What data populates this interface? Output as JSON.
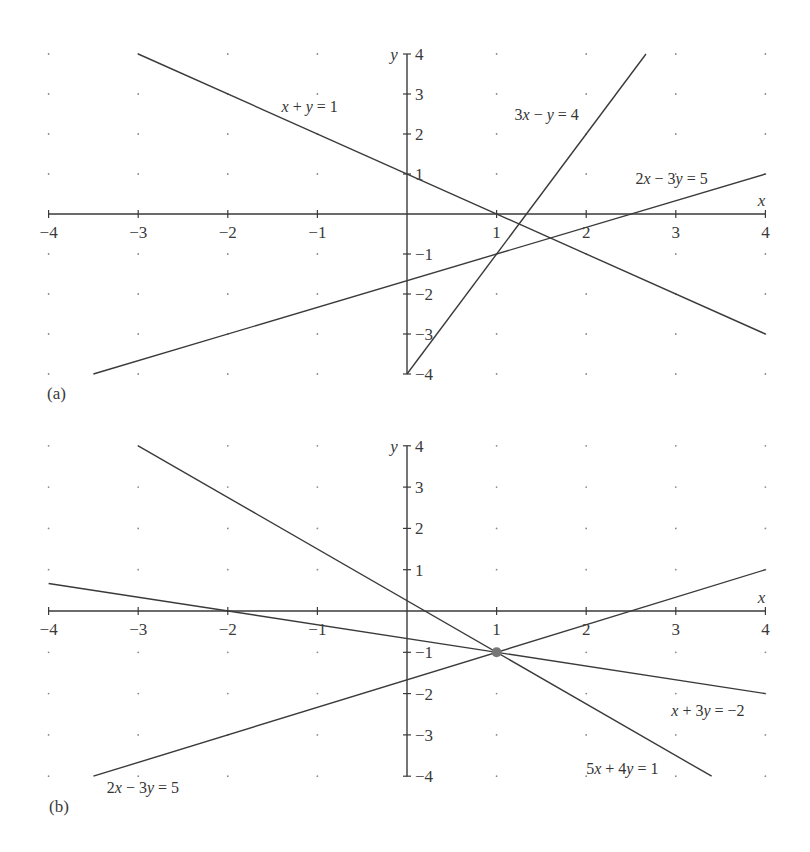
{
  "chart_data": [
    {
      "type": "line",
      "panel_label": "(a)",
      "title": "",
      "xlabel": "x",
      "ylabel": "y",
      "xlim": [
        -4,
        4
      ],
      "ylim": [
        -4,
        4
      ],
      "grid": "dotted points at integer coordinates",
      "x_ticks": [
        -4,
        -3,
        -2,
        -1,
        1,
        2,
        3,
        4
      ],
      "y_ticks": [
        -4,
        -3,
        -2,
        -1,
        1,
        2,
        3,
        4
      ],
      "x_tick_labels": [
        "−4",
        "−3",
        "−2",
        "−1",
        "1",
        "2",
        "3",
        "4"
      ],
      "y_tick_labels": [
        "−4",
        "−3",
        "−2",
        "−1",
        "1",
        "2",
        "3",
        "4"
      ],
      "series": [
        {
          "name": "x + y = 1",
          "x": [
            -3,
            4
          ],
          "y": [
            4,
            -3
          ]
        },
        {
          "name": "3x − y = 4",
          "x": [
            0,
            2.667
          ],
          "y": [
            -4,
            4
          ]
        },
        {
          "name": "2x − 3y = 5",
          "x": [
            -3.5,
            4
          ],
          "y": [
            -4,
            1
          ]
        }
      ],
      "annotations": [
        {
          "text": "x + y = 1",
          "at": [
            -1.4,
            2.55
          ]
        },
        {
          "text": "3x − y = 4",
          "at": [
            1.2,
            2.35
          ]
        },
        {
          "text": "2x − 3y = 5",
          "at": [
            2.55,
            0.75
          ]
        }
      ]
    },
    {
      "type": "line",
      "panel_label": "(b)",
      "title": "",
      "xlabel": "x",
      "ylabel": "y",
      "xlim": [
        -4,
        4
      ],
      "ylim": [
        -4,
        4
      ],
      "grid": "dotted points at integer coordinates",
      "x_ticks": [
        -4,
        -3,
        -2,
        -1,
        1,
        2,
        3,
        4
      ],
      "y_ticks": [
        -4,
        -3,
        -2,
        -1,
        1,
        2,
        3,
        4
      ],
      "x_tick_labels": [
        "−4",
        "−3",
        "−2",
        "−1",
        "1",
        "2",
        "3",
        "4"
      ],
      "y_tick_labels": [
        "−4",
        "−3",
        "−2",
        "−1",
        "1",
        "2",
        "3",
        "4"
      ],
      "series": [
        {
          "name": "2x − 3y = 5",
          "x": [
            -3.5,
            4
          ],
          "y": [
            -4,
            1
          ]
        },
        {
          "name": "x + 3y = −2",
          "x": [
            -4,
            4
          ],
          "y": [
            0.667,
            -2
          ]
        },
        {
          "name": "5x + 4y = 1",
          "x": [
            -3,
            3.4
          ],
          "y": [
            4,
            -4
          ]
        }
      ],
      "points": [
        {
          "label": "intersection",
          "x": 1,
          "y": -1,
          "color": "#777777"
        }
      ],
      "annotations": [
        {
          "text": "2x − 3y = 5",
          "at": [
            -3.35,
            -4.4
          ]
        },
        {
          "text": "x + 3y = −2",
          "at": [
            2.95,
            -2.55
          ]
        },
        {
          "text": "5x + 4y = 1",
          "at": [
            2.0,
            -3.95
          ]
        }
      ]
    }
  ],
  "panels": {
    "a": {
      "label": "(a)"
    },
    "b": {
      "label": "(b)"
    }
  },
  "colors": {
    "line": "#3a3a3a",
    "axis": "#3a3a3a",
    "grid_dot": "#8a8a8a",
    "intersection": "#777777"
  }
}
